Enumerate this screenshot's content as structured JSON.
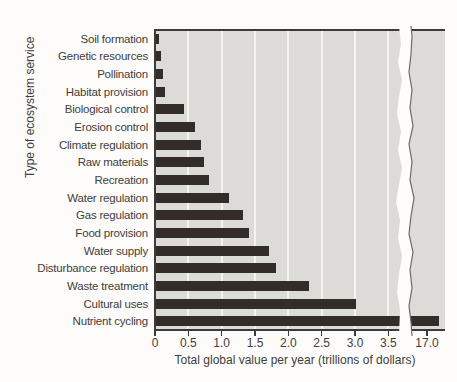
{
  "chart_data": {
    "type": "bar",
    "orientation": "horizontal",
    "title": "",
    "ylabel": "Type of ecosystem service",
    "xlabel": "Total global value per year (trillions of dollars)",
    "categories": [
      "Soil formation",
      "Genetic resources",
      "Pollination",
      "Habitat provision",
      "Biological control",
      "Erosion control",
      "Climate regulation",
      "Raw materials",
      "Recreation",
      "Water regulation",
      "Gas regulation",
      "Food provision",
      "Water supply",
      "Disturbance regulation",
      "Waste treatment",
      "Cultural uses",
      "Nutrient cycling"
    ],
    "values": [
      0.05,
      0.08,
      0.1,
      0.13,
      0.42,
      0.58,
      0.68,
      0.72,
      0.8,
      1.1,
      1.3,
      1.4,
      1.7,
      1.8,
      2.3,
      3.0,
      17.0
    ],
    "x_tick_labels": [
      "0",
      "0.5",
      "1.0",
      "1.5",
      "2.0",
      "2.5",
      "3.0",
      "3.5",
      "17.0"
    ],
    "x_tick_values": [
      0,
      0.5,
      1.0,
      1.5,
      2.0,
      2.5,
      3.0,
      3.5,
      17.0
    ],
    "axis_break": {
      "between_ticks": [
        3.5,
        17.0
      ],
      "style": "wavy-gap"
    },
    "grid": {
      "vertical_gridlines_at": [
        0.5,
        1.0,
        1.5,
        2.0,
        2.5,
        3.0,
        3.5
      ]
    },
    "legend": "none",
    "colors": {
      "bar": "#332d2a",
      "plot_background": "#dcdbd8",
      "gridline": "#f4f3f0",
      "axis": "#3e3a37",
      "text": "#3f3e3c",
      "page_background": "#fdfcfa"
    }
  }
}
